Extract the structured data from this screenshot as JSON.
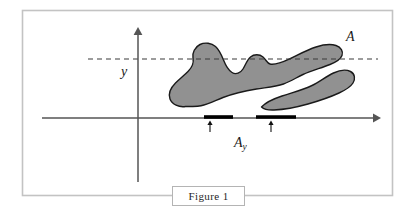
{
  "figure": {
    "caption": "Figure 1",
    "labels": {
      "set_label": "A",
      "axis_label": "y",
      "slice_label_base": "A",
      "slice_label_sub": "y"
    },
    "colors": {
      "region_fill": "#919191",
      "region_stroke": "#1a1a1a",
      "axis": "#555555",
      "dashed_line": "#3a3a3a",
      "frame": "#c3c3c3",
      "caption_border": "#b4b4b4",
      "bar": "#000000",
      "background": "#ffffff"
    },
    "elements": {
      "frame": "outer-rectangle-border",
      "y_axis": "vertical-arrow-axis",
      "x_axis": "horizontal-arrow-axis",
      "dashed_level_line": "horizontal-dashed-line-at-height-y",
      "region_A": "two-blob-shaded-region",
      "projection_bars": "two-thick-segments-on-x-axis",
      "pointer_arrows": "two-small-up-arrows"
    },
    "geometry": {
      "frame": {
        "x": 22,
        "y": 10,
        "width": 371,
        "height": 186
      },
      "x_axis": {
        "x1": 42,
        "y1": 118,
        "x2": 379,
        "y2": 118
      },
      "y_axis": {
        "x1": 138,
        "y1": 182,
        "x2": 138,
        "y2": 31
      },
      "dashed_line": {
        "x1": 88,
        "y": 59,
        "x2": 378
      },
      "bars": [
        {
          "x1": 204,
          "x2": 233,
          "y": 117
        },
        {
          "x1": 256,
          "x2": 296,
          "y": 117
        }
      ],
      "pointer_arrows": [
        {
          "x": 210,
          "y_base": 131,
          "y_tip": 121
        },
        {
          "x": 271,
          "y_base": 131,
          "y_tip": 121
        }
      ]
    }
  }
}
